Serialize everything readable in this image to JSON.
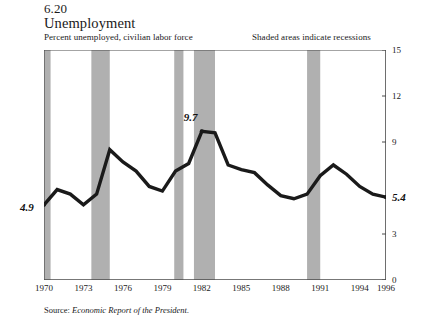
{
  "figure": {
    "number": "6.20",
    "title": "Unemployment",
    "subtitle": "Percent unemployed, civilian labor force",
    "note": "Shaded areas indicate recessions",
    "source_label": "Source:",
    "source_title": "Economic Report of the President."
  },
  "colors": {
    "line": "#1a1a1a",
    "recession_band": "#b0b0b0",
    "axis": "#4a4a4a",
    "background": "#ffffff",
    "text": "#1a1a1a"
  },
  "annotations": {
    "start": "4.9",
    "peak": "9.7",
    "end": "5.4"
  },
  "chart_data": {
    "type": "line",
    "title": "Unemployment",
    "subtitle": "Percent unemployed, civilian labor force",
    "xlabel": "",
    "ylabel": "Percent unemployed, civilian labor force",
    "xlim": [
      1970,
      1996
    ],
    "ylim": [
      0,
      15
    ],
    "grid": false,
    "legend": null,
    "y_ticks": [
      0,
      3,
      9,
      12,
      15
    ],
    "y_tick_labels": [
      "0",
      "3",
      "9",
      "12",
      "15"
    ],
    "x_ticks": [
      1970,
      1973,
      1976,
      1979,
      1982,
      1985,
      1988,
      1991,
      1994,
      1996
    ],
    "x_tick_labels": [
      "1970",
      "1973",
      "1976",
      "1979",
      "1982",
      "1985",
      "1988",
      "1991",
      "1994",
      "1996"
    ],
    "x": [
      1970,
      1971,
      1972,
      1973,
      1974,
      1975,
      1976,
      1977,
      1978,
      1979,
      1980,
      1981,
      1982,
      1983,
      1984,
      1985,
      1986,
      1987,
      1988,
      1989,
      1990,
      1991,
      1992,
      1993,
      1994,
      1995,
      1996
    ],
    "values": [
      4.9,
      5.9,
      5.6,
      4.9,
      5.6,
      8.5,
      7.7,
      7.1,
      6.1,
      5.8,
      7.1,
      7.6,
      9.7,
      9.6,
      7.5,
      7.2,
      7.0,
      6.2,
      5.5,
      5.3,
      5.6,
      6.8,
      7.5,
      6.9,
      6.1,
      5.6,
      5.4
    ],
    "series_name": "Civilian unemployment rate",
    "annotated_points": [
      {
        "x": 1970,
        "y": 4.9,
        "label": "4.9"
      },
      {
        "x": 1982,
        "y": 9.7,
        "label": "9.7"
      },
      {
        "x": 1996,
        "y": 5.4,
        "label": "5.4"
      }
    ],
    "recession_bands": [
      {
        "start": 1969.9,
        "end": 1970.5
      },
      {
        "start": 1973.6,
        "end": 1975.0
      },
      {
        "start": 1979.9,
        "end": 1980.6
      },
      {
        "start": 1981.4,
        "end": 1983.0
      },
      {
        "start": 1990.0,
        "end": 1991.0
      }
    ]
  }
}
